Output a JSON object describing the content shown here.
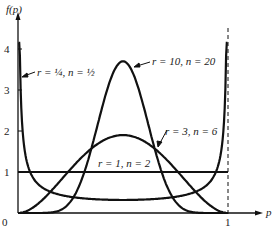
{
  "chart_data": {
    "type": "line",
    "title": "",
    "xlabel": "p",
    "ylabel": "f(p)",
    "xlim": [
      0,
      1
    ],
    "ylim": [
      0,
      4.3
    ],
    "x_ticks": [
      "0",
      "1"
    ],
    "y_ticks": [
      "1",
      "2",
      "3",
      "4"
    ],
    "grid": false,
    "legend": "inline annotations",
    "annotations": {
      "vertical_dashed_line_at_p": 1
    },
    "series": [
      {
        "name": "r = 1/4, n = 1/2",
        "label_r": "1/4",
        "label_n": "1/2",
        "alpha": 0.25,
        "beta": 0.25,
        "shape": "U-shaped, near 0.32 at p=0.5, rising steeply to >4 at both ends"
      },
      {
        "name": "r = 10, n = 20",
        "label_r": "10",
        "label_n": "20",
        "alpha": 10,
        "beta": 10,
        "peak": 3.7,
        "peak_at_p": 0.5
      },
      {
        "name": "r = 3, n = 6",
        "label_r": "3",
        "label_n": "6",
        "alpha": 3,
        "beta": 3,
        "peak": 1.9,
        "peak_at_p": 0.5
      },
      {
        "name": "r = 1, n = 2",
        "label_r": "1",
        "label_n": "2",
        "alpha": 1,
        "beta": 1,
        "constant": 1
      }
    ]
  },
  "labels": {
    "ylabel": "f(p)",
    "xlabel": "p",
    "origin": "0",
    "x_one": "1",
    "y1": "1",
    "y2": "2",
    "y3": "3",
    "y4": "4",
    "s1": "r = ¼, n = ½",
    "s2": "r = 10, n = 20",
    "s3": "r = 3, n = 6",
    "s4": "r = 1, n = 2"
  }
}
